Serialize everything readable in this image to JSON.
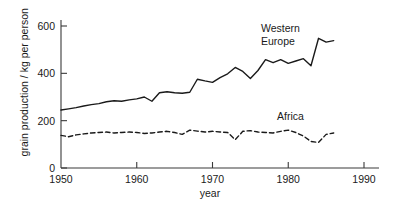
{
  "chart_data": {
    "type": "line",
    "title": "",
    "xlabel": "year",
    "ylabel": "grain production / kg per person",
    "xlim": [
      1950,
      1992
    ],
    "ylim": [
      0,
      640
    ],
    "grid": false,
    "legend_position": "inline-annotation",
    "x_ticks": [
      1950,
      1960,
      1970,
      1980,
      1990
    ],
    "x_tick_labels": [
      "1950",
      "1960",
      "1970",
      "1980",
      "1990"
    ],
    "y_ticks": [
      0,
      200,
      400,
      600
    ],
    "y_tick_labels": [
      "0",
      "200",
      "400",
      "600"
    ],
    "x": [
      1950,
      1951,
      1952,
      1953,
      1954,
      1955,
      1956,
      1957,
      1958,
      1959,
      1960,
      1961,
      1962,
      1963,
      1964,
      1965,
      1966,
      1967,
      1968,
      1969,
      1970,
      1971,
      1972,
      1973,
      1974,
      1975,
      1976,
      1977,
      1978,
      1979,
      1980,
      1981,
      1982,
      1983,
      1984,
      1985,
      1986
    ],
    "series": [
      {
        "name": "Western Europe",
        "label": "Western\nEurope",
        "style": "solid",
        "color": "#1a1a1a",
        "values": [
          245,
          250,
          255,
          262,
          268,
          272,
          280,
          284,
          282,
          288,
          292,
          300,
          282,
          318,
          322,
          318,
          316,
          320,
          375,
          368,
          362,
          382,
          398,
          425,
          408,
          378,
          412,
          458,
          445,
          458,
          442,
          452,
          462,
          432,
          548,
          532,
          538
        ]
      },
      {
        "name": "Africa",
        "label": "Africa",
        "style": "dashed",
        "color": "#1a1a1a",
        "values": [
          138,
          132,
          140,
          144,
          148,
          150,
          152,
          148,
          150,
          152,
          150,
          146,
          148,
          152,
          155,
          150,
          142,
          160,
          156,
          152,
          155,
          152,
          150,
          120,
          155,
          158,
          152,
          150,
          148,
          155,
          160,
          150,
          135,
          112,
          108,
          142,
          148
        ]
      }
    ],
    "annotations": [
      {
        "text": "Western\nEurope",
        "x": 1976,
        "y": 600
      },
      {
        "text": "Africa",
        "x": 1978,
        "y": 235
      }
    ]
  },
  "axes": {
    "y_label": "grain production / kg per person",
    "x_label": "year"
  },
  "labels": {
    "western_europe": "Western\nEurope",
    "africa": "Africa"
  }
}
